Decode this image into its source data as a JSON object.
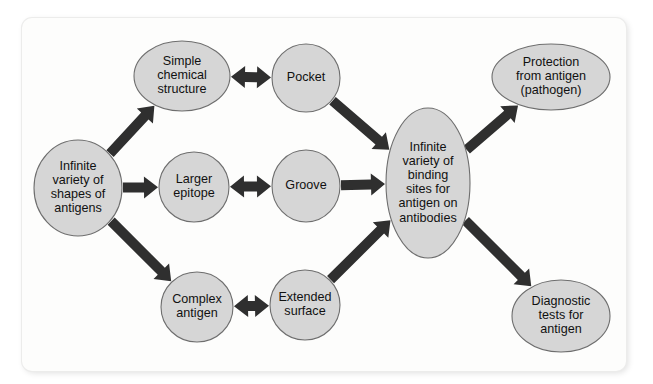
{
  "figure": {
    "background_color": "#ffffff",
    "panel_color": "#fdfdfc",
    "node_fill_color": "#d6d6d6",
    "node_stroke_color": "#6e6e6e",
    "arrow_color": "#2f2f2f",
    "text_color": "#111111"
  },
  "diagram_data": {
    "type": "flowchart",
    "nodes": [
      {
        "id": "antigen-shapes",
        "shape": "ellipse",
        "cx": 78,
        "cy": 188,
        "rx": 44,
        "ry": 48,
        "lines": [
          "Infinite",
          "variety of",
          "shapes of",
          "antigens"
        ]
      },
      {
        "id": "simple-chemical-structure",
        "shape": "ellipse",
        "cx": 182,
        "cy": 76,
        "rx": 48,
        "ry": 35,
        "lines": [
          "Simple",
          "chemical",
          "structure"
        ]
      },
      {
        "id": "larger-epitope",
        "shape": "ellipse",
        "cx": 194,
        "cy": 187,
        "rx": 35,
        "ry": 35,
        "lines": [
          "Larger",
          "epitope"
        ]
      },
      {
        "id": "complex-antigen",
        "shape": "ellipse",
        "cx": 197,
        "cy": 307,
        "rx": 36,
        "ry": 35,
        "lines": [
          "Complex",
          "antigen"
        ]
      },
      {
        "id": "pocket",
        "shape": "ellipse",
        "cx": 306,
        "cy": 78,
        "rx": 34,
        "ry": 34,
        "lines": [
          "Pocket"
        ]
      },
      {
        "id": "groove",
        "shape": "ellipse",
        "cx": 306,
        "cy": 186,
        "rx": 34,
        "ry": 36,
        "lines": [
          "Groove"
        ]
      },
      {
        "id": "extended-surface",
        "shape": "ellipse",
        "cx": 305,
        "cy": 305,
        "rx": 35,
        "ry": 35,
        "lines": [
          "Extended",
          "surface"
        ]
      },
      {
        "id": "binding-sites",
        "shape": "ellipse",
        "cx": 428,
        "cy": 183,
        "rx": 42,
        "ry": 75,
        "lines": [
          "Infinite",
          "variety of",
          "binding",
          "sites for",
          "antigen on",
          "antibodies"
        ]
      },
      {
        "id": "protection",
        "shape": "ellipse",
        "cx": 551,
        "cy": 77,
        "rx": 59,
        "ry": 33,
        "lines": [
          "Protection",
          "from antigen",
          "(pathogen)"
        ]
      },
      {
        "id": "diagnostic-tests",
        "shape": "ellipse",
        "cx": 561,
        "cy": 316,
        "rx": 49,
        "ry": 36,
        "lines": [
          "Diagnostic",
          "tests for",
          "antigen"
        ]
      }
    ],
    "edges": [
      {
        "id": "edge-antigen-to-simple",
        "from": "antigen-shapes",
        "to": "simple-chemical-structure",
        "direction": "single"
      },
      {
        "id": "edge-antigen-to-larger",
        "from": "antigen-shapes",
        "to": "larger-epitope",
        "direction": "single"
      },
      {
        "id": "edge-antigen-to-complex",
        "from": "antigen-shapes",
        "to": "complex-antigen",
        "direction": "single"
      },
      {
        "id": "edge-simple-to-pocket",
        "from": "simple-chemical-structure",
        "to": "pocket",
        "direction": "double"
      },
      {
        "id": "edge-larger-to-groove",
        "from": "larger-epitope",
        "to": "groove",
        "direction": "double"
      },
      {
        "id": "edge-complex-to-extended",
        "from": "complex-antigen",
        "to": "extended-surface",
        "direction": "double"
      },
      {
        "id": "edge-pocket-to-binding",
        "from": "pocket",
        "to": "binding-sites",
        "direction": "single"
      },
      {
        "id": "edge-groove-to-binding",
        "from": "groove",
        "to": "binding-sites",
        "direction": "single"
      },
      {
        "id": "edge-extended-to-binding",
        "from": "extended-surface",
        "to": "binding-sites",
        "direction": "single"
      },
      {
        "id": "edge-binding-to-protection",
        "from": "binding-sites",
        "to": "protection",
        "direction": "single"
      },
      {
        "id": "edge-binding-to-diagnostic",
        "from": "binding-sites",
        "to": "diagnostic-tests",
        "direction": "single"
      }
    ]
  }
}
